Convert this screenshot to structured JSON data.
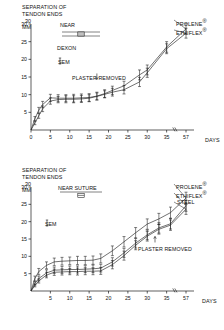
{
  "figure": {
    "panels": [
      {
        "id": "top",
        "axis_title_line1": "SEPARATION OF",
        "axis_title_line2": "TENDON ENDS",
        "y_unit_top": "30",
        "y_unit": "MM",
        "legend_title": "NEAR",
        "legend_sub1": "DEXON",
        "legend_sub2": "SEM",
        "annotation": "PLASTER REMOVED",
        "series_labels": [
          "PROLENE",
          "ETHIFLEX"
        ],
        "x_axis_unit": "DAYS"
      },
      {
        "id": "bottom",
        "axis_title_line1": "SEPARATION OF",
        "axis_title_line2": "TENDON ENDS",
        "y_unit_top": "30",
        "y_unit": "MM",
        "legend_title": "NEAR SUTURE",
        "legend_sub2": "SEM",
        "annotation": "PLASTER REMOVED",
        "series_labels": [
          "PROLENE",
          "ETHIFLEX",
          "STEEL"
        ],
        "x_axis_unit": "DAYS"
      }
    ]
  },
  "chart_data": [
    {
      "type": "line",
      "id": "near-dexon",
      "title": "SEPARATION OF TENDON ENDS",
      "xlabel": "DAYS",
      "ylabel": "MM",
      "xlim": [
        0,
        40
      ],
      "ylim": [
        0,
        30
      ],
      "xticks": [
        0,
        5,
        10,
        15,
        20,
        25,
        30,
        35
      ],
      "xtick_labels": [
        "0",
        "5",
        "10",
        "15",
        "20",
        "25",
        "30",
        "35"
      ],
      "axis_break_after": 37,
      "final_tick_label": "57",
      "yticks": [
        5,
        10,
        15,
        20,
        25,
        30
      ],
      "grid": false,
      "legend_position": "upper-left",
      "legend_title": "NEAR",
      "legend_note": "DEXON",
      "error_bar_label": "SEM",
      "annotations": [
        {
          "text": "PLASTER REMOVED",
          "x": 17,
          "y": 16,
          "arrow": "down"
        }
      ],
      "series": [
        {
          "name": "PROLENE",
          "x": [
            0,
            1,
            2,
            3,
            5,
            7,
            9,
            11,
            13,
            15,
            17,
            19,
            21,
            24,
            28,
            30,
            35,
            40
          ],
          "values": [
            0,
            3.2,
            5.6,
            7.2,
            9.1,
            9.0,
            9.0,
            9.0,
            9.1,
            9.2,
            9.6,
            10.3,
            11.2,
            12.5,
            15.6,
            17.0,
            23.5,
            28.6
          ],
          "sem": [
            0,
            0.6,
            0.8,
            0.9,
            1.0,
            1.0,
            1.0,
            1.1,
            1.1,
            1.1,
            1.1,
            1.1,
            1.2,
            1.3,
            1.4,
            1.4,
            1.5,
            1.5
          ]
        },
        {
          "name": "ETHIFLEX",
          "x": [
            0,
            1,
            2,
            3,
            5,
            7,
            9,
            11,
            13,
            15,
            17,
            19,
            21,
            24,
            28,
            30,
            35,
            40
          ],
          "values": [
            0,
            2.0,
            4.0,
            6.0,
            8.2,
            8.6,
            8.7,
            8.7,
            8.8,
            9.0,
            9.5,
            10.1,
            10.7,
            11.4,
            13.6,
            16.2,
            23.0,
            27.4
          ],
          "sem": [
            0,
            0.5,
            0.7,
            0.8,
            0.9,
            0.9,
            1.0,
            1.0,
            1.0,
            1.0,
            1.0,
            1.0,
            1.1,
            1.2,
            1.3,
            1.3,
            1.4,
            1.4
          ]
        }
      ]
    },
    {
      "type": "line",
      "id": "near-suture",
      "title": "SEPARATION OF TENDON ENDS",
      "xlabel": "DAYS",
      "ylabel": "MM",
      "xlim": [
        0,
        40
      ],
      "ylim": [
        0,
        30
      ],
      "xticks": [
        5,
        10,
        15,
        20,
        25,
        30,
        35
      ],
      "xtick_labels": [
        "5",
        "10",
        "15",
        "20",
        "25",
        "30",
        "35"
      ],
      "axis_break_after": 37,
      "final_tick_label": "57",
      "yticks": [
        5,
        10,
        15,
        20,
        25,
        30
      ],
      "grid": false,
      "legend_position": "upper-left",
      "legend_title": "NEAR SUTURE",
      "error_bar_label": "SEM",
      "annotations": [
        {
          "text": "PLASTER REMOVED",
          "x": 32,
          "y": 14,
          "arrow": "up"
        }
      ],
      "series": [
        {
          "name": "PROLENE",
          "x": [
            0,
            1,
            2,
            4,
            6,
            8,
            10,
            12,
            14,
            16,
            18,
            21,
            24,
            27,
            30,
            33,
            36,
            40
          ],
          "values": [
            0,
            3.6,
            5.6,
            7.4,
            8.4,
            8.6,
            8.7,
            8.8,
            8.8,
            8.9,
            9.4,
            11.6,
            14.2,
            16.8,
            19.3,
            20.8,
            22.6,
            26.8
          ],
          "sem": [
            0,
            0.7,
            0.9,
            1.0,
            1.1,
            1.1,
            1.1,
            1.2,
            1.2,
            1.2,
            1.3,
            1.4,
            1.5,
            1.5,
            1.5,
            1.6,
            1.6,
            1.7
          ]
        },
        {
          "name": "ETHIFLEX",
          "x": [
            0,
            1,
            2,
            4,
            6,
            8,
            10,
            12,
            14,
            16,
            18,
            21,
            24,
            27,
            30,
            33,
            36,
            40
          ],
          "values": [
            0,
            2.2,
            3.6,
            5.2,
            6.0,
            6.1,
            6.2,
            6.2,
            6.3,
            6.4,
            6.6,
            8.4,
            11.0,
            13.8,
            16.2,
            18.2,
            19.4,
            24.6
          ],
          "sem": [
            0,
            0.5,
            0.7,
            0.9,
            0.9,
            1.0,
            1.0,
            1.0,
            1.0,
            1.1,
            1.1,
            1.2,
            1.3,
            1.4,
            1.4,
            1.5,
            1.5,
            1.6
          ]
        },
        {
          "name": "STEEL",
          "x": [
            0,
            1,
            2,
            4,
            6,
            8,
            10,
            12,
            14,
            16,
            18,
            21,
            24,
            27,
            30,
            33,
            36,
            40
          ],
          "values": [
            0,
            1.6,
            2.9,
            4.6,
            5.4,
            5.5,
            5.6,
            5.6,
            5.7,
            5.7,
            5.8,
            7.6,
            10.2,
            13.2,
            15.8,
            17.8,
            19.0,
            23.6
          ],
          "sem": [
            0,
            0.4,
            0.6,
            0.8,
            0.9,
            0.9,
            0.9,
            1.0,
            1.0,
            1.0,
            1.0,
            1.2,
            1.3,
            1.3,
            1.4,
            1.4,
            1.5,
            1.5
          ]
        }
      ]
    }
  ]
}
